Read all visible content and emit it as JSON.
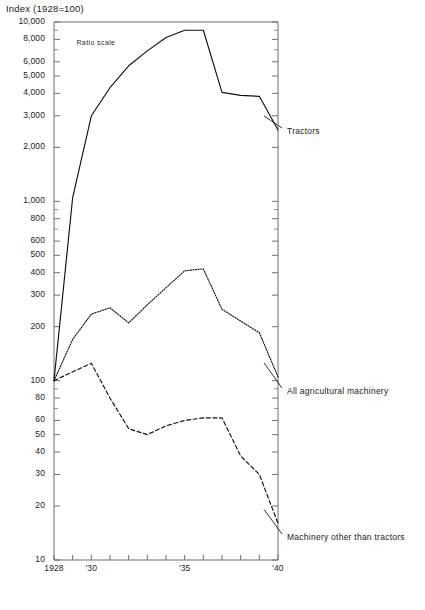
{
  "chart_data": {
    "type": "line",
    "title": "Index (1928=100)",
    "subtitle": "Ratio scale",
    "xlabel": "",
    "ylabel": "Index (1928=100)",
    "scale": "log",
    "grid": false,
    "legend_position": "right-inline",
    "ylim": [
      10,
      10000
    ],
    "xlim": [
      1928,
      1940
    ],
    "y_ticks": [
      10,
      20,
      30,
      40,
      50,
      60,
      80,
      100,
      200,
      300,
      400,
      500,
      600,
      800,
      1000,
      2000,
      3000,
      4000,
      5000,
      6000,
      8000,
      10000
    ],
    "y_tick_labels": [
      "10",
      "20",
      "30",
      "40",
      "50",
      "60",
      "80",
      "100",
      "200",
      "300",
      "400",
      "500",
      "600",
      "800",
      "1,000",
      "2,000",
      "3,000",
      "4,000",
      "5,000",
      "6,000",
      "8,000",
      "10,000"
    ],
    "x_ticks": [
      1928,
      1929,
      1930,
      1931,
      1932,
      1933,
      1934,
      1935,
      1936,
      1937,
      1938,
      1939,
      1940
    ],
    "x_tick_labels": [
      "1928",
      "",
      "'30",
      "",
      "",
      "",
      "",
      "'35",
      "",
      "",
      "",
      "",
      "'40"
    ],
    "x": [
      1928,
      1929,
      1930,
      1931,
      1932,
      1933,
      1934,
      1935,
      1936,
      1937,
      1938,
      1939,
      1940
    ],
    "series": [
      {
        "name": "Tractors",
        "style": "solid",
        "values": [
          100,
          1050,
          3000,
          4300,
          5700,
          6900,
          8200,
          9000,
          9000,
          4050,
          3900,
          3850,
          2500
        ]
      },
      {
        "name": "All agricultural machinery",
        "style": "dotted",
        "values": [
          100,
          170,
          235,
          255,
          210,
          265,
          330,
          410,
          420,
          250,
          215,
          185,
          105
        ]
      },
      {
        "name": "Machinery other than tractors",
        "style": "dashed",
        "values": [
          100,
          112,
          125,
          80,
          54,
          50,
          56,
          60,
          62,
          62,
          38,
          30,
          16
        ]
      }
    ],
    "annotations": [
      {
        "text": "Ratio scale",
        "x": 1929.2,
        "y": 7600
      }
    ]
  }
}
